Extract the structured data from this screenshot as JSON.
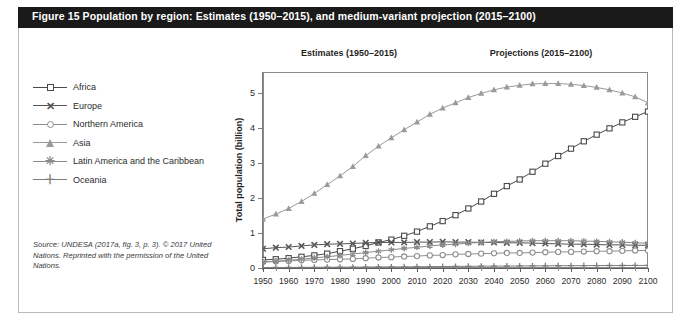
{
  "figure": {
    "label": "Figure 15",
    "title": "Figure 15   Population by region: Estimates (1950–2015), and medium-variant projection (2015–2100)"
  },
  "source_note": "Source: UNDESA (2017a, fig. 3, p. 3). © 2017 United Nations. Reprinted with the permission of the United Nations.",
  "captions": {
    "estimates": "Estimates (1950–2015)",
    "projections": "Projections (2015–2100)"
  },
  "legend": {
    "items": [
      {
        "label": "Africa",
        "marker": "square-marker-icon",
        "color": "#4a4a4a"
      },
      {
        "label": "Europe",
        "marker": "cross-marker-icon",
        "color": "#555555"
      },
      {
        "label": "Northern America",
        "marker": "circle-marker-icon",
        "color": "#8e8e8e"
      },
      {
        "label": "Asia",
        "marker": "triangle-marker-icon",
        "color": "#9a9a9a"
      },
      {
        "label": "Latin America and the Caribbean",
        "marker": "star-marker-icon",
        "color": "#8a8a8a"
      },
      {
        "label": "Oceania",
        "marker": "plus-marker-icon",
        "color": "#7d7d7d"
      }
    ]
  },
  "chart_data": {
    "type": "line",
    "title": "Population by region: Estimates (1950–2015), and medium-variant projection (2015–2100)",
    "xlabel": "",
    "ylabel": "Total population (billion)",
    "xlim": [
      1950,
      2100
    ],
    "ylim": [
      0,
      5.6
    ],
    "yticks": [
      0,
      1,
      2,
      3,
      4,
      5
    ],
    "xticks": [
      1950,
      1960,
      1970,
      1980,
      1990,
      2000,
      2010,
      2020,
      2030,
      2040,
      2050,
      2060,
      2070,
      2080,
      2090,
      2100
    ],
    "grid": true,
    "legend_position": "left-outside",
    "projection_start": 2017,
    "annotations": [
      "Estimates (1950–2015)",
      "Projections (2015–2100)"
    ],
    "x": [
      1950,
      1955,
      1960,
      1965,
      1970,
      1975,
      1980,
      1985,
      1990,
      1995,
      2000,
      2005,
      2010,
      2015,
      2020,
      2025,
      2030,
      2035,
      2040,
      2045,
      2050,
      2055,
      2060,
      2065,
      2070,
      2075,
      2080,
      2085,
      2090,
      2095,
      2100
    ],
    "series": [
      {
        "name": "Africa",
        "marker": "square",
        "color": "#4a4a4a",
        "values": [
          0.23,
          0.25,
          0.28,
          0.32,
          0.36,
          0.41,
          0.48,
          0.55,
          0.63,
          0.73,
          0.81,
          0.92,
          1.04,
          1.19,
          1.34,
          1.51,
          1.7,
          1.9,
          2.12,
          2.34,
          2.53,
          2.75,
          2.98,
          3.2,
          3.41,
          3.62,
          3.81,
          3.99,
          4.16,
          4.32,
          4.47
        ]
      },
      {
        "name": "Europe",
        "marker": "cross",
        "color": "#555555",
        "values": [
          0.55,
          0.58,
          0.6,
          0.63,
          0.66,
          0.68,
          0.69,
          0.7,
          0.72,
          0.73,
          0.73,
          0.73,
          0.74,
          0.74,
          0.75,
          0.74,
          0.74,
          0.73,
          0.73,
          0.72,
          0.72,
          0.71,
          0.7,
          0.69,
          0.68,
          0.68,
          0.67,
          0.66,
          0.66,
          0.65,
          0.65
        ]
      },
      {
        "name": "Northern America",
        "marker": "circle",
        "color": "#8e8e8e",
        "values": [
          0.17,
          0.19,
          0.2,
          0.22,
          0.23,
          0.24,
          0.25,
          0.26,
          0.28,
          0.3,
          0.31,
          0.33,
          0.34,
          0.36,
          0.37,
          0.39,
          0.4,
          0.41,
          0.42,
          0.43,
          0.43,
          0.44,
          0.45,
          0.46,
          0.46,
          0.47,
          0.48,
          0.48,
          0.49,
          0.5,
          0.5
        ]
      },
      {
        "name": "Asia",
        "marker": "triangle",
        "color": "#9a9a9a",
        "values": [
          1.4,
          1.54,
          1.7,
          1.9,
          2.13,
          2.38,
          2.63,
          2.9,
          3.21,
          3.48,
          3.72,
          3.95,
          4.17,
          4.39,
          4.57,
          4.72,
          4.87,
          4.99,
          5.09,
          5.17,
          5.22,
          5.26,
          5.27,
          5.27,
          5.25,
          5.21,
          5.16,
          5.09,
          5.0,
          4.89,
          4.72
        ]
      },
      {
        "name": "Latin America and the Caribbean",
        "marker": "star",
        "color": "#8a8a8a",
        "values": [
          0.17,
          0.19,
          0.22,
          0.25,
          0.29,
          0.32,
          0.36,
          0.4,
          0.44,
          0.48,
          0.52,
          0.56,
          0.59,
          0.63,
          0.66,
          0.68,
          0.71,
          0.73,
          0.75,
          0.76,
          0.77,
          0.78,
          0.78,
          0.78,
          0.78,
          0.77,
          0.76,
          0.75,
          0.74,
          0.72,
          0.71
        ]
      },
      {
        "name": "Oceania",
        "marker": "plus",
        "color": "#7d7d7d",
        "values": [
          0.013,
          0.014,
          0.016,
          0.018,
          0.02,
          0.021,
          0.023,
          0.025,
          0.027,
          0.029,
          0.031,
          0.033,
          0.036,
          0.039,
          0.042,
          0.045,
          0.048,
          0.051,
          0.053,
          0.056,
          0.058,
          0.06,
          0.062,
          0.064,
          0.066,
          0.068,
          0.069,
          0.071,
          0.072,
          0.073,
          0.074
        ]
      }
    ]
  }
}
